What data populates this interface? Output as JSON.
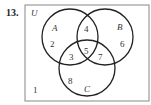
{
  "problem_number": "13.",
  "diagram": {
    "universe_label": "U",
    "sets": [
      {
        "name": "A",
        "label": "A"
      },
      {
        "name": "B",
        "label": "B"
      },
      {
        "name": "C",
        "label": "C"
      }
    ],
    "regions": [
      {
        "id": "outside",
        "value": "1"
      },
      {
        "id": "A-only",
        "value": "2"
      },
      {
        "id": "A-and-C",
        "value": "3"
      },
      {
        "id": "A-and-B",
        "value": "4"
      },
      {
        "id": "A-B-C",
        "value": "5"
      },
      {
        "id": "B-only",
        "value": "6"
      },
      {
        "id": "B-and-C",
        "value": "7"
      },
      {
        "id": "C-only",
        "value": "8"
      }
    ],
    "colors": {
      "stroke": "#222222",
      "border": "#888888"
    }
  }
}
